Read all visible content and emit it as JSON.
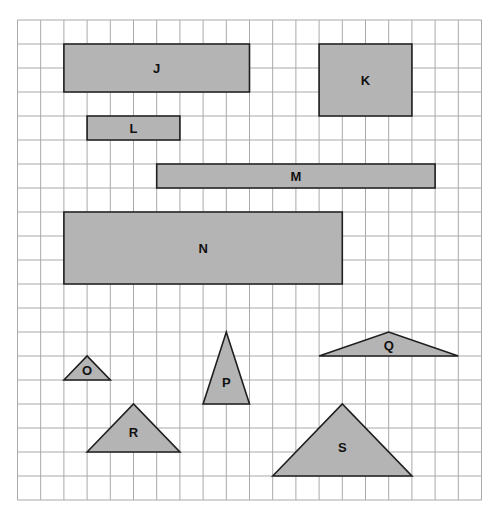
{
  "grid": {
    "origin_x": 17.5,
    "origin_y": 20,
    "cell_w": 23.2,
    "cell_h": 24,
    "cols": 20,
    "rows": 20,
    "line_color": "#a9a9a9",
    "shape_fill": "#b4b4b4",
    "shape_stroke": "#1e1e1e"
  },
  "shapes": [
    {
      "id": "J",
      "label": "J",
      "type": "rectangle",
      "points": [
        [
          2,
          1
        ],
        [
          10,
          1
        ],
        [
          10,
          3
        ],
        [
          2,
          3
        ]
      ],
      "label_at": [
        6,
        2
      ]
    },
    {
      "id": "K",
      "label": "K",
      "type": "rectangle",
      "points": [
        [
          13,
          1
        ],
        [
          17,
          1
        ],
        [
          17,
          4
        ],
        [
          13,
          4
        ]
      ],
      "label_at": [
        15,
        2.5
      ]
    },
    {
      "id": "L",
      "label": "L",
      "type": "rectangle",
      "points": [
        [
          3,
          4
        ],
        [
          7,
          4
        ],
        [
          7,
          5
        ],
        [
          3,
          5
        ]
      ],
      "label_at": [
        5,
        4.5
      ]
    },
    {
      "id": "M",
      "label": "M",
      "type": "rectangle",
      "points": [
        [
          6,
          6
        ],
        [
          18,
          6
        ],
        [
          18,
          7
        ],
        [
          6,
          7
        ]
      ],
      "label_at": [
        12,
        6.5
      ]
    },
    {
      "id": "N",
      "label": "N",
      "type": "rectangle",
      "points": [
        [
          2,
          8
        ],
        [
          14,
          8
        ],
        [
          14,
          11
        ],
        [
          2,
          11
        ]
      ],
      "label_at": [
        8,
        9.5
      ]
    },
    {
      "id": "O",
      "label": "O",
      "type": "triangle",
      "points": [
        [
          2,
          15
        ],
        [
          3,
          14
        ],
        [
          4,
          15
        ]
      ],
      "label_at": [
        3,
        14.6
      ]
    },
    {
      "id": "P",
      "label": "P",
      "type": "triangle",
      "points": [
        [
          8,
          16
        ],
        [
          9,
          13
        ],
        [
          10,
          16
        ]
      ],
      "label_at": [
        9,
        15.1
      ]
    },
    {
      "id": "Q",
      "label": "Q",
      "type": "triangle",
      "points": [
        [
          13,
          14
        ],
        [
          16,
          13
        ],
        [
          19,
          14
        ]
      ],
      "label_at": [
        16,
        13.55
      ]
    },
    {
      "id": "R",
      "label": "R",
      "type": "triangle",
      "points": [
        [
          3,
          18
        ],
        [
          5,
          16
        ],
        [
          7,
          18
        ]
      ],
      "label_at": [
        5,
        17.2
      ]
    },
    {
      "id": "S",
      "label": "S",
      "type": "triangle",
      "points": [
        [
          11,
          19
        ],
        [
          14,
          16
        ],
        [
          17,
          19
        ]
      ],
      "label_at": [
        14,
        17.8
      ]
    }
  ]
}
